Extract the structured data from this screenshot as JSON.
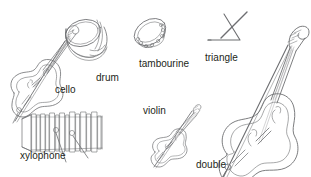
{
  "diagram": {
    "background_color": "#ffffff",
    "line_color": "#6d6e71",
    "text_color": "#231f20",
    "labels": [
      {
        "name": "cello",
        "text": "cello"
      },
      {
        "name": "drum",
        "text": "drum"
      },
      {
        "name": "tambourine",
        "text": "tambourine"
      },
      {
        "name": "triangle",
        "text": "triangle"
      },
      {
        "name": "violin",
        "text": "violin"
      },
      {
        "name": "double-bass",
        "text_line1": "double",
        "text_line2": "bass"
      },
      {
        "name": "xylophone",
        "text": "xylophone"
      }
    ]
  }
}
